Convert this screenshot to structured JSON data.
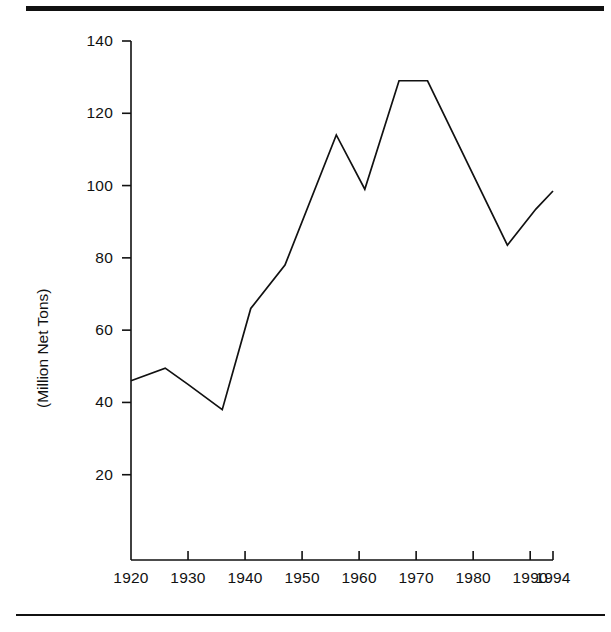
{
  "figure": {
    "top_rule": "horizontal-rule",
    "bottom_rule": "horizontal-rule"
  },
  "chart_data": {
    "type": "line",
    "title": "",
    "subtitle": "",
    "xlabel": "",
    "ylabel": "(Million Net Tons)",
    "xlim": [
      1920,
      1994
    ],
    "ylim": [
      0,
      140
    ],
    "grid": false,
    "legend": null,
    "xticks": [
      1920,
      1930,
      1940,
      1950,
      1960,
      1970,
      1980,
      1990,
      1994
    ],
    "xtick_labels": [
      "1920",
      "1930",
      "1940",
      "1950",
      "1960",
      "1970",
      "1980",
      "1990",
      "1994"
    ],
    "yticks": [
      20,
      40,
      60,
      80,
      100,
      120,
      140
    ],
    "ytick_labels": [
      "20",
      "40",
      "60",
      "80",
      "100",
      "120",
      "140"
    ],
    "series": [
      {
        "name": "Million Net Tons",
        "color": "#111111",
        "x": [
          1920,
          1926,
          1930,
          1936,
          1941,
          1947,
          1956,
          1961,
          1967,
          1972,
          1986,
          1991,
          1994
        ],
        "values": [
          46,
          49.5,
          45,
          38,
          66,
          78,
          114,
          99,
          129,
          129,
          83.5,
          93.5,
          98.5
        ]
      }
    ]
  }
}
